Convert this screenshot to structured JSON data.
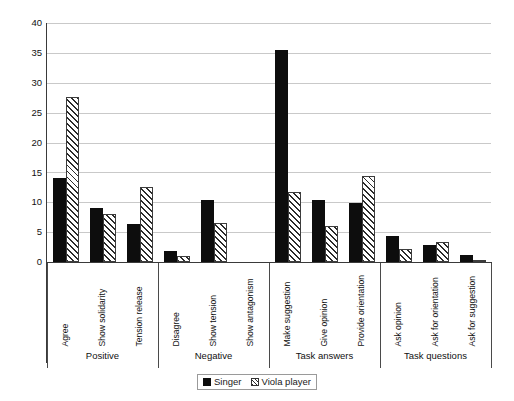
{
  "chart_data": {
    "type": "bar",
    "title": "",
    "xlabel": "",
    "ylabel": "",
    "ylim": [
      0,
      40
    ],
    "yticks": [
      0,
      5,
      10,
      15,
      20,
      25,
      30,
      35,
      40
    ],
    "grid": true,
    "legend_position": "bottom",
    "categories": [
      "Agree",
      "Show solidarity",
      "Tension release",
      "Disagree",
      "Show tension",
      "Show antagonism",
      "Make suggestion",
      "Give opinion",
      "Provide orientation",
      "Ask opinion",
      "Ask for orientation",
      "Ask for suggestion"
    ],
    "groups": [
      {
        "label": "Positive",
        "span": 3
      },
      {
        "label": "Negative",
        "span": 3
      },
      {
        "label": "Task answers",
        "span": 3
      },
      {
        "label": "Task questions",
        "span": 3
      }
    ],
    "series": [
      {
        "name": "Singer",
        "style": "solid-black",
        "color": "#0d0d0d",
        "values": [
          14.0,
          9.0,
          6.3,
          1.9,
          10.4,
          0.0,
          35.5,
          10.4,
          9.8,
          4.4,
          2.9,
          1.1
        ]
      },
      {
        "name": "Viola player",
        "style": "diagonal-hatch",
        "color": "#2b2b2b",
        "values": [
          27.7,
          8.0,
          12.5,
          1.0,
          6.5,
          0.0,
          11.7,
          6.0,
          14.4,
          2.2,
          3.4,
          0.2
        ]
      }
    ]
  },
  "axis": {
    "y_tick_labels": [
      "40",
      "35",
      "30",
      "25",
      "20",
      "15",
      "10",
      "5",
      "0"
    ]
  },
  "legend": {
    "items": [
      {
        "label": "Singer"
      },
      {
        "label": "Viola player"
      }
    ]
  }
}
